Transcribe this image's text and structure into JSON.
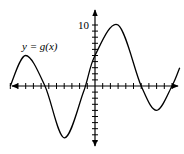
{
  "chart_data": {
    "type": "line",
    "title": "",
    "function_label": "y = g(x)",
    "xlabel": "",
    "ylabel": "",
    "y_tick_label": "10",
    "xlim": [
      -13,
      11
    ],
    "ylim": [
      -11,
      12
    ],
    "x_tick_spacing": 1,
    "y_tick_spacing": 1,
    "grid": false,
    "series": [
      {
        "name": "g(x)",
        "points": [
          [
            -11,
            0
          ],
          [
            -9,
            5
          ],
          [
            -6.5,
            0
          ],
          [
            -4,
            -8.5
          ],
          [
            -1.5,
            -1
          ],
          [
            0,
            5
          ],
          [
            3,
            10
          ],
          [
            6,
            0
          ],
          [
            8,
            -4
          ],
          [
            10,
            0
          ],
          [
            11,
            3
          ]
        ]
      }
    ]
  }
}
